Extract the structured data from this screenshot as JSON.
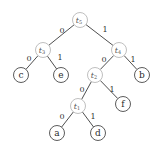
{
  "diagram": {
    "type": "binary-tree",
    "root": "t5",
    "nodes": [
      {
        "id": "t5",
        "label": "t",
        "sub": "5",
        "kind": "internal",
        "x": 80,
        "y": 20
      },
      {
        "id": "t3",
        "label": "t",
        "sub": "3",
        "kind": "internal",
        "x": 43,
        "y": 50
      },
      {
        "id": "t4",
        "label": "t",
        "sub": "4",
        "kind": "internal",
        "x": 119,
        "y": 50
      },
      {
        "id": "c",
        "label": "c",
        "kind": "leaf",
        "x": 21,
        "y": 75
      },
      {
        "id": "e",
        "label": "e",
        "kind": "leaf",
        "x": 61,
        "y": 75
      },
      {
        "id": "t2",
        "label": "t",
        "sub": "2",
        "kind": "internal",
        "x": 95,
        "y": 75
      },
      {
        "id": "b",
        "label": "b",
        "kind": "leaf",
        "x": 142,
        "y": 75
      },
      {
        "id": "t1",
        "label": "t",
        "sub": "1",
        "kind": "internal",
        "x": 78,
        "y": 106
      },
      {
        "id": "f",
        "label": "f",
        "kind": "leaf",
        "x": 123,
        "y": 104
      },
      {
        "id": "a",
        "label": "a",
        "kind": "leaf",
        "x": 57,
        "y": 133
      },
      {
        "id": "d",
        "label": "d",
        "kind": "leaf",
        "x": 98,
        "y": 133
      }
    ],
    "edges": [
      {
        "from": "t5",
        "to": "t3",
        "label": "0",
        "lx": 62,
        "ly": 30
      },
      {
        "from": "t5",
        "to": "t4",
        "label": "1",
        "lx": 105,
        "ly": 29
      },
      {
        "from": "t3",
        "to": "c",
        "label": "0",
        "lx": 29,
        "ly": 58
      },
      {
        "from": "t3",
        "to": "e",
        "label": "1",
        "lx": 60,
        "ly": 57
      },
      {
        "from": "t4",
        "to": "t2",
        "label": "0",
        "lx": 104,
        "ly": 59
      },
      {
        "from": "t4",
        "to": "b",
        "label": "1",
        "lx": 133,
        "ly": 59
      },
      {
        "from": "t2",
        "to": "t1",
        "label": "0",
        "lx": 82,
        "ly": 89
      },
      {
        "from": "t2",
        "to": "f",
        "label": "1",
        "lx": 112,
        "ly": 89
      },
      {
        "from": "t1",
        "to": "a",
        "label": "0",
        "lx": 62,
        "ly": 116
      },
      {
        "from": "t1",
        "to": "d",
        "label": "1",
        "lx": 93,
        "ly": 116
      }
    ],
    "node_radius": 7.5,
    "colors": {
      "edge": "#3a3a3a",
      "internal_stroke": "#b8b8b8",
      "leaf_stroke": "#4a4a4a",
      "text": "#2a2a2a"
    }
  }
}
